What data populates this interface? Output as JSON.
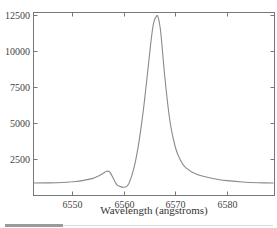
{
  "chart_data": {
    "type": "line",
    "title": "",
    "xlabel": "Wavelength (angstroms)",
    "ylabel": "",
    "xlim": [
      6542.5,
      6589
    ],
    "ylim": [
      0,
      12700
    ],
    "grid": false,
    "legend": null,
    "x_ticks": [
      6550,
      6560,
      6570,
      6580
    ],
    "x_tick_labels": [
      "6550",
      "6560",
      "6570",
      "6580"
    ],
    "y_ticks": [
      2500,
      5000,
      7500,
      10000,
      12500
    ],
    "y_tick_labels": [
      "2500",
      "5000",
      "7500",
      "10000",
      "12500"
    ],
    "series": [
      {
        "name": "spectrum",
        "x": [
          6542.5,
          6545,
          6548,
          6550,
          6552,
          6554,
          6555,
          6556,
          6556.7,
          6557.3,
          6558,
          6558.7,
          6559.5,
          6560.3,
          6561,
          6562,
          6563,
          6564,
          6565,
          6565.7,
          6566.3,
          6566.7,
          6567.2,
          6568,
          6569,
          6570,
          6571,
          6572,
          6574,
          6576,
          6578,
          6580,
          6583,
          6586,
          6589
        ],
        "values": [
          830,
          840,
          870,
          920,
          1000,
          1150,
          1300,
          1500,
          1650,
          1600,
          1150,
          700,
          560,
          560,
          800,
          1900,
          3800,
          6500,
          9800,
          11800,
          12400,
          12300,
          11200,
          8000,
          5000,
          3300,
          2400,
          1900,
          1450,
          1250,
          1100,
          1000,
          900,
          850,
          830
        ]
      }
    ],
    "annotations": []
  },
  "scrollbar": {
    "thumb_fraction": 0.22
  }
}
